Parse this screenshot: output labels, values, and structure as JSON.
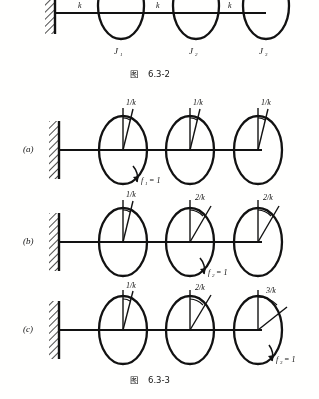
{
  "document": {
    "kind": "textbook-figure-scan",
    "page_background": "#fdfdfc",
    "ink_color": "#141414"
  },
  "figure_top": {
    "caption_prefix": "图",
    "caption_number": "6.3-2",
    "wall": "fixed-support",
    "shaft_labels": [
      "k",
      "k",
      "k"
    ],
    "disk_labels": [
      "J",
      "J",
      "J"
    ],
    "disk_subscripts": [
      "1",
      "2",
      "3"
    ],
    "disk_count": 3
  },
  "figure_bottom": {
    "caption_prefix": "图",
    "caption_number": "6.3-3",
    "panels": [
      {
        "id": "a",
        "label": "(a)",
        "angles": [
          "1/k",
          "1/k",
          "1/k"
        ],
        "force_label": "f",
        "force_subscript": "1",
        "force_value": "= 1",
        "force_at_disk": 1
      },
      {
        "id": "b",
        "label": "(b)",
        "angles": [
          "1/k",
          "2/k",
          "2/k"
        ],
        "force_label": "f",
        "force_subscript": "2",
        "force_value": "= 1",
        "force_at_disk": 2
      },
      {
        "id": "c",
        "label": "(c)",
        "angles": [
          "1/k",
          "2/k",
          "3/k"
        ],
        "force_label": "f",
        "force_subscript": "3",
        "force_value": "= 1",
        "force_at_disk": 3
      }
    ]
  }
}
